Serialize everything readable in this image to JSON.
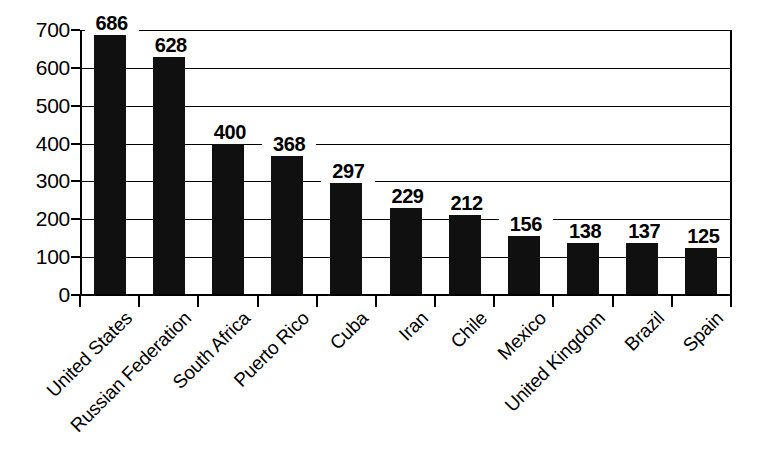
{
  "chart_data": {
    "type": "bar",
    "title": "",
    "subtitle": "",
    "xlabel": "",
    "ylabel": "",
    "categories": [
      "United States",
      "Russian Federation",
      "South Africa",
      "Puerto Rico",
      "Cuba",
      "Iran",
      "Chile",
      "Mexico",
      "United Kingdom",
      "Brazil",
      "Spain"
    ],
    "values": [
      686,
      628,
      400,
      368,
      297,
      229,
      212,
      156,
      138,
      137,
      125
    ],
    "value_labels": [
      "686",
      "628",
      "400",
      "368",
      "297",
      "229",
      "212",
      "156",
      "138",
      "137",
      "125"
    ],
    "ylim": [
      0,
      700
    ],
    "ytick_values": [
      0,
      100,
      200,
      300,
      400,
      500,
      600,
      700
    ],
    "ytick_labels": [
      "0",
      "100",
      "200",
      "300",
      "400",
      "500",
      "600",
      "700"
    ],
    "grid": true,
    "grid_axis": "y",
    "legend": false,
    "legend_position": "none",
    "bar_color": "#101010",
    "background_color": "#ffffff",
    "axis_color": "#000000",
    "label_rotation": -45
  }
}
